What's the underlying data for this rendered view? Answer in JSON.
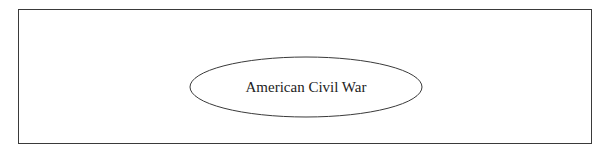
{
  "diagram": {
    "nodes": [
      {
        "id": "root",
        "shape": "ellipse",
        "label": "American Civil War"
      }
    ],
    "edges": [],
    "colors": {
      "stroke": "#3a3a3a",
      "background": "#ffffff",
      "text": "#222222"
    }
  }
}
